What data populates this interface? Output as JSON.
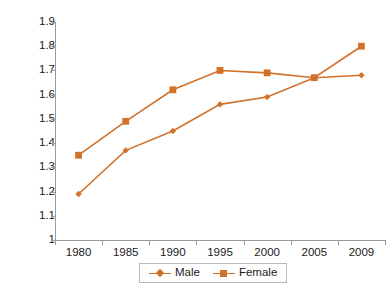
{
  "chart_data": {
    "type": "line",
    "title": "",
    "subtitle": "",
    "xlabel": "",
    "ylabel": "",
    "categories": [
      "1980",
      "1985",
      "1990",
      "1995",
      "2000",
      "2005",
      "2009"
    ],
    "x": [
      1980,
      1985,
      1990,
      1995,
      2000,
      2005,
      2009
    ],
    "series": [
      {
        "name": "Male",
        "marker": "diamond",
        "color": "#D2722A",
        "values": [
          1.19,
          1.37,
          1.45,
          1.56,
          1.59,
          1.67,
          1.68
        ]
      },
      {
        "name": "Female",
        "marker": "square",
        "color": "#D2722A",
        "values": [
          1.35,
          1.49,
          1.62,
          1.7,
          1.69,
          1.67,
          1.8
        ]
      }
    ],
    "ylim": [
      1.0,
      1.9
    ],
    "yticks": [
      1,
      1.1,
      1.2,
      1.3,
      1.4,
      1.5,
      1.6,
      1.7,
      1.8,
      1.9
    ],
    "ytick_labels": [
      "1",
      "1.1",
      "1.2",
      "1.3",
      "1.4",
      "1.5",
      "1.6",
      "1.7",
      "1.8",
      "1.9"
    ],
    "grid": false,
    "legend_position": "bottom"
  },
  "legend": {
    "entries": [
      {
        "label": "Male"
      },
      {
        "label": "Female"
      }
    ]
  },
  "colors": {
    "series": "#D2722A",
    "axis": "#9a9a9a",
    "text": "#1a1a1a",
    "legend_border": "#b9b9b9",
    "background": "#ffffff"
  }
}
